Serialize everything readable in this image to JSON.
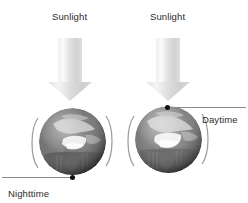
{
  "diagram": {
    "background_color": "#ffffff",
    "text_color": "#2b2b2b",
    "arrow_color": "#d8d8d8",
    "marker_color": "#111111",
    "axis_line_color": "#8a8a8a"
  },
  "left_scene": {
    "sunlight_label": "Sunlight",
    "arrow_icon": "down-arrow-icon",
    "globe_icon": "earth-globe-icon",
    "marker_label": "Nighttime",
    "marker_position": "bottom",
    "rotation_arcs": 2
  },
  "right_scene": {
    "sunlight_label": "Sunlight",
    "arrow_icon": "down-arrow-icon",
    "globe_icon": "earth-globe-icon",
    "marker_label": "Daytime",
    "marker_position": "top",
    "rotation_arcs": 2
  }
}
